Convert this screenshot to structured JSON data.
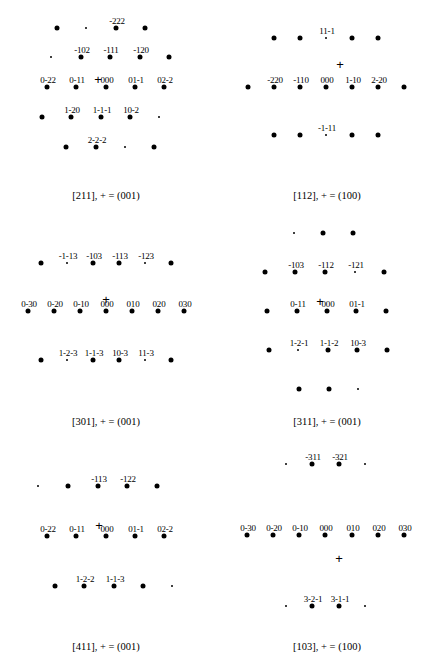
{
  "figure": {
    "panels": [
      {
        "id": "p211",
        "caption": "[211], + = (001)",
        "caption_pos": [
          106,
          190
        ],
        "plus": [
          98,
          79
        ],
        "spots": [
          {
            "x": 57,
            "y": 28,
            "s": "big"
          },
          {
            "x": 86,
            "y": 28,
            "s": "small"
          },
          {
            "x": 116,
            "y": 28,
            "s": "big",
            "label": "-222"
          },
          {
            "x": 145,
            "y": 28,
            "s": "big"
          },
          {
            "x": 51,
            "y": 57,
            "s": "small"
          },
          {
            "x": 81,
            "y": 57,
            "s": "big",
            "label": "-102"
          },
          {
            "x": 110,
            "y": 57,
            "s": "big",
            "label": "-111"
          },
          {
            "x": 140,
            "y": 57,
            "s": "big",
            "label": "-120"
          },
          {
            "x": 169,
            "y": 57,
            "s": "big"
          },
          {
            "x": 47,
            "y": 87,
            "s": "big",
            "label": "0-22"
          },
          {
            "x": 76,
            "y": 87,
            "s": "big",
            "label": "0-11"
          },
          {
            "x": 106,
            "y": 87,
            "s": "big",
            "label": "000"
          },
          {
            "x": 135,
            "y": 87,
            "s": "big",
            "label": "01-1"
          },
          {
            "x": 164,
            "y": 87,
            "s": "big",
            "label": "02-2"
          },
          {
            "x": 42,
            "y": 117,
            "s": "big"
          },
          {
            "x": 71,
            "y": 117,
            "s": "big",
            "label": "1-20"
          },
          {
            "x": 101,
            "y": 117,
            "s": "big",
            "label": "1-1-1"
          },
          {
            "x": 130,
            "y": 117,
            "s": "big",
            "label": "10-2"
          },
          {
            "x": 159,
            "y": 117,
            "s": "small"
          },
          {
            "x": 66,
            "y": 147,
            "s": "big"
          },
          {
            "x": 96,
            "y": 147,
            "s": "big",
            "label": "2-2-2"
          },
          {
            "x": 125,
            "y": 147,
            "s": "small"
          },
          {
            "x": 154,
            "y": 147,
            "s": "big"
          }
        ]
      },
      {
        "id": "p112",
        "caption": "[112], + = (100)",
        "caption_pos": [
          327,
          190
        ],
        "plus": [
          340,
          64
        ],
        "spots": [
          {
            "x": 274,
            "y": 38,
            "s": "big"
          },
          {
            "x": 300,
            "y": 38,
            "s": "big"
          },
          {
            "x": 326,
            "y": 38,
            "s": "small",
            "label": "11-1"
          },
          {
            "x": 352,
            "y": 38,
            "s": "big"
          },
          {
            "x": 378,
            "y": 38,
            "s": "big"
          },
          {
            "x": 248,
            "y": 87,
            "s": "big"
          },
          {
            "x": 274,
            "y": 87,
            "s": "big",
            "label": "-220"
          },
          {
            "x": 300,
            "y": 87,
            "s": "big",
            "label": "-110"
          },
          {
            "x": 326,
            "y": 87,
            "s": "big",
            "label": "000"
          },
          {
            "x": 352,
            "y": 87,
            "s": "big",
            "label": "1-10"
          },
          {
            "x": 378,
            "y": 87,
            "s": "big",
            "label": "2-20"
          },
          {
            "x": 404,
            "y": 87,
            "s": "big"
          },
          {
            "x": 274,
            "y": 135,
            "s": "big"
          },
          {
            "x": 300,
            "y": 135,
            "s": "big"
          },
          {
            "x": 326,
            "y": 135,
            "s": "small",
            "label": "-1-11"
          },
          {
            "x": 352,
            "y": 135,
            "s": "big"
          },
          {
            "x": 378,
            "y": 135,
            "s": "big"
          }
        ]
      },
      {
        "id": "p301",
        "caption": "[301], + = (001)",
        "caption_pos": [
          106,
          416
        ],
        "plus": [
          106,
          299
        ],
        "spots": [
          {
            "x": 41,
            "y": 263,
            "s": "big"
          },
          {
            "x": 67,
            "y": 263,
            "s": "small",
            "label": "-1-13"
          },
          {
            "x": 93,
            "y": 263,
            "s": "big",
            "label": "-103"
          },
          {
            "x": 119,
            "y": 263,
            "s": "big",
            "label": "-113"
          },
          {
            "x": 145,
            "y": 263,
            "s": "small",
            "label": "-123"
          },
          {
            "x": 171,
            "y": 263,
            "s": "big"
          },
          {
            "x": 28,
            "y": 311,
            "s": "big",
            "label": "0-30"
          },
          {
            "x": 54,
            "y": 311,
            "s": "big",
            "label": "0-20"
          },
          {
            "x": 80,
            "y": 311,
            "s": "big",
            "label": "0-10"
          },
          {
            "x": 106,
            "y": 311,
            "s": "big",
            "label": "000"
          },
          {
            "x": 132,
            "y": 311,
            "s": "big",
            "label": "010"
          },
          {
            "x": 158,
            "y": 311,
            "s": "big",
            "label": "020"
          },
          {
            "x": 184,
            "y": 311,
            "s": "big",
            "label": "030"
          },
          {
            "x": 41,
            "y": 360,
            "s": "big"
          },
          {
            "x": 67,
            "y": 360,
            "s": "small",
            "label": "1-2-3"
          },
          {
            "x": 93,
            "y": 360,
            "s": "big",
            "label": "1-1-3"
          },
          {
            "x": 119,
            "y": 360,
            "s": "big",
            "label": "10-3"
          },
          {
            "x": 145,
            "y": 360,
            "s": "small",
            "label": "11-3"
          },
          {
            "x": 171,
            "y": 360,
            "s": "big"
          }
        ]
      },
      {
        "id": "p311",
        "caption": "[311], + = (001)",
        "caption_pos": [
          327,
          416
        ],
        "plus": [
          320,
          301
        ],
        "spots": [
          {
            "x": 294,
            "y": 233,
            "s": "small"
          },
          {
            "x": 323,
            "y": 233,
            "s": "big"
          },
          {
            "x": 353,
            "y": 233,
            "s": "big"
          },
          {
            "x": 265,
            "y": 272,
            "s": "big"
          },
          {
            "x": 295,
            "y": 272,
            "s": "big",
            "label": "-103"
          },
          {
            "x": 325,
            "y": 272,
            "s": "big",
            "label": "-112"
          },
          {
            "x": 355,
            "y": 272,
            "s": "small",
            "label": "-121"
          },
          {
            "x": 384,
            "y": 272,
            "s": "big"
          },
          {
            "x": 267,
            "y": 311,
            "s": "big"
          },
          {
            "x": 297,
            "y": 311,
            "s": "big",
            "label": "0-11"
          },
          {
            "x": 327,
            "y": 311,
            "s": "big",
            "label": "000"
          },
          {
            "x": 356,
            "y": 311,
            "s": "big",
            "label": "01-1"
          },
          {
            "x": 386,
            "y": 311,
            "s": "big"
          },
          {
            "x": 269,
            "y": 350,
            "s": "big"
          },
          {
            "x": 298,
            "y": 350,
            "s": "small",
            "label": "1-2-1"
          },
          {
            "x": 328,
            "y": 350,
            "s": "big",
            "label": "1-1-2"
          },
          {
            "x": 357,
            "y": 350,
            "s": "big",
            "label": "10-3"
          },
          {
            "x": 387,
            "y": 350,
            "s": "big"
          },
          {
            "x": 299,
            "y": 389,
            "s": "big"
          },
          {
            "x": 329,
            "y": 389,
            "s": "big"
          },
          {
            "x": 358,
            "y": 389,
            "s": "small"
          }
        ]
      },
      {
        "id": "p411",
        "caption": "[411], + = (001)",
        "caption_pos": [
          106,
          641
        ],
        "plus": [
          99,
          525
        ],
        "spots": [
          {
            "x": 38,
            "y": 486,
            "s": "small"
          },
          {
            "x": 68,
            "y": 486,
            "s": "big"
          },
          {
            "x": 98,
            "y": 486,
            "s": "big",
            "label": "-113"
          },
          {
            "x": 127,
            "y": 486,
            "s": "big",
            "label": "-122"
          },
          {
            "x": 157,
            "y": 486,
            "s": "big"
          },
          {
            "x": 47,
            "y": 536,
            "s": "big",
            "label": "0-22"
          },
          {
            "x": 76,
            "y": 536,
            "s": "big",
            "label": "0-11"
          },
          {
            "x": 106,
            "y": 536,
            "s": "big",
            "label": "000"
          },
          {
            "x": 135,
            "y": 536,
            "s": "big",
            "label": "01-1"
          },
          {
            "x": 164,
            "y": 536,
            "s": "big",
            "label": "02-2"
          },
          {
            "x": 55,
            "y": 586,
            "s": "big"
          },
          {
            "x": 84,
            "y": 586,
            "s": "big",
            "label": "1-2-2"
          },
          {
            "x": 114,
            "y": 586,
            "s": "big",
            "label": "1-1-3"
          },
          {
            "x": 143,
            "y": 586,
            "s": "big"
          },
          {
            "x": 172,
            "y": 586,
            "s": "small"
          }
        ]
      },
      {
        "id": "p103",
        "caption": "[103], + = (100)",
        "caption_pos": [
          327,
          641
        ],
        "plus": [
          339,
          558
        ],
        "spots": [
          {
            "x": 286,
            "y": 464,
            "s": "small"
          },
          {
            "x": 312,
            "y": 464,
            "s": "big",
            "label": "-311"
          },
          {
            "x": 339,
            "y": 464,
            "s": "big",
            "label": "-321"
          },
          {
            "x": 365,
            "y": 464,
            "s": "small"
          },
          {
            "x": 247,
            "y": 535,
            "s": "big",
            "label": "0-30"
          },
          {
            "x": 273,
            "y": 535,
            "s": "big",
            "label": "0-20"
          },
          {
            "x": 299,
            "y": 535,
            "s": "big",
            "label": "0-10"
          },
          {
            "x": 325,
            "y": 535,
            "s": "big",
            "label": "000"
          },
          {
            "x": 352,
            "y": 535,
            "s": "big",
            "label": "010"
          },
          {
            "x": 378,
            "y": 535,
            "s": "big",
            "label": "020"
          },
          {
            "x": 404,
            "y": 535,
            "s": "big",
            "label": "030"
          },
          {
            "x": 286,
            "y": 606,
            "s": "small"
          },
          {
            "x": 312,
            "y": 606,
            "s": "big",
            "label": "3-2-1"
          },
          {
            "x": 339,
            "y": 606,
            "s": "big",
            "label": "3-1-1"
          },
          {
            "x": 365,
            "y": 606,
            "s": "small"
          }
        ]
      }
    ],
    "plus_glyph": "+"
  }
}
